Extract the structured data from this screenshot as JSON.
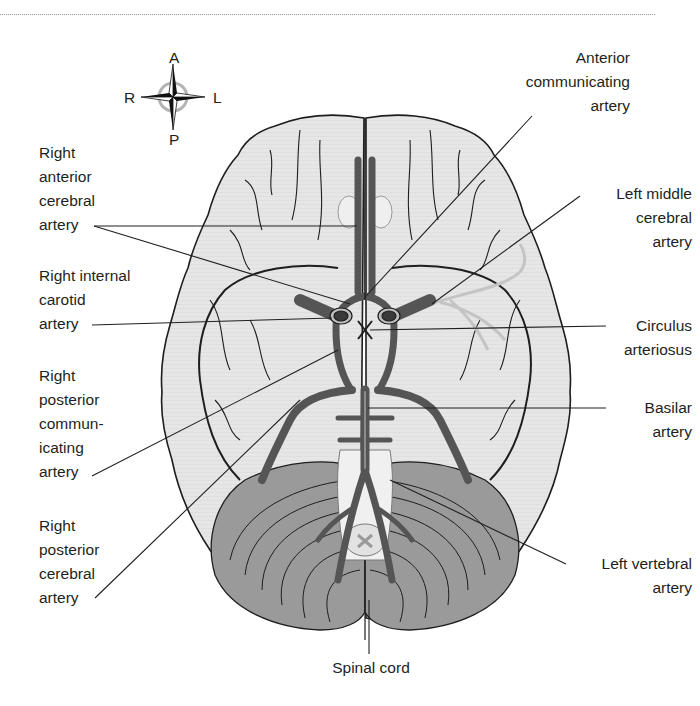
{
  "figure": {
    "type": "anatomical-diagram",
    "colors": {
      "background": "#ffffff",
      "cerebrum_fill": "#e4e4e4",
      "cerebellum_fill": "#9a9a9a",
      "artery_fill": "#5a5a5a",
      "outline": "#1e1e1e",
      "label_text": "#231f20",
      "leader_line": "#231f20"
    }
  },
  "compass": {
    "anterior": "A",
    "posterior": "P",
    "right": "R",
    "left": "L"
  },
  "labels": {
    "anterior_communicating_artery": "Anterior\ncommunicating\nartery",
    "right_anterior_cerebral_artery": "Right\nanterior\ncerebral\nartery",
    "left_middle_cerebral_artery": "Left middle\ncerebral\nartery",
    "right_internal_carotid_artery": "Right internal\ncarotid\nartery",
    "circulus_arteriosus": "Circulus\narteriosus",
    "right_posterior_communicating_artery": "Right\nposterior\ncommun-\nicating\nartery",
    "basilar_artery": "Basilar\nartery",
    "right_posterior_cerebral_artery": "Right\nposterior\ncerebral\nartery",
    "left_vertebral_artery": "Left vertebral\nartery",
    "spinal_cord": "Spinal cord"
  }
}
